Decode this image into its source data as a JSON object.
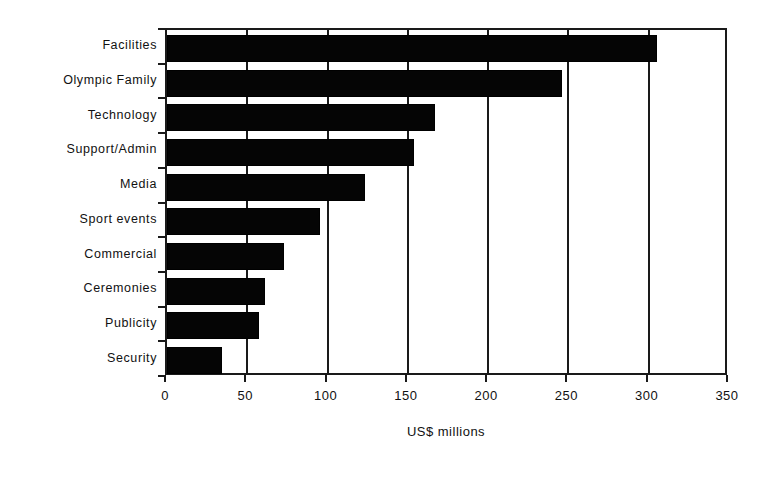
{
  "chart_data": {
    "type": "bar",
    "orientation": "horizontal",
    "title": "",
    "xlabel": "US$ millions",
    "ylabel": "",
    "xlim": [
      0,
      350
    ],
    "xticks": [
      0,
      50,
      100,
      150,
      200,
      250,
      300,
      350
    ],
    "grid": true,
    "grid_axis": "x",
    "legend": false,
    "bar_color": "#050505",
    "axis_color": "#1a1a1a",
    "background": "#ffffff",
    "categories": [
      "Facilities",
      "Olympic Family",
      "Technology",
      "Support/Admin",
      "Media",
      "Sport events",
      "Commercial",
      "Ceremonies",
      "Publicity",
      "Security"
    ],
    "values": [
      305,
      246,
      167,
      154,
      123,
      95,
      73,
      61,
      57,
      34
    ],
    "series": [
      {
        "name": "US$ millions",
        "values": [
          305,
          246,
          167,
          154,
          123,
          95,
          73,
          61,
          57,
          34
        ]
      }
    ]
  }
}
